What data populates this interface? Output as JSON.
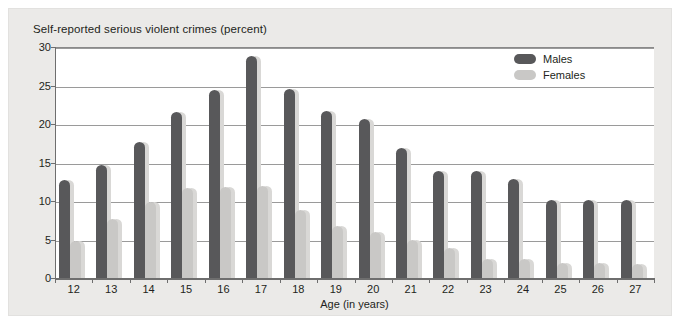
{
  "chart_data": {
    "type": "bar",
    "title": "Self-reported serious violent crimes (percent)",
    "xlabel": "Age (in years)",
    "ylabel": "",
    "ylim": [
      0,
      30
    ],
    "yticks": [
      0,
      5,
      10,
      15,
      20,
      25,
      30
    ],
    "grid": true,
    "legend_position": "top-right",
    "categories": [
      "12",
      "13",
      "14",
      "15",
      "16",
      "17",
      "18",
      "19",
      "20",
      "21",
      "22",
      "23",
      "24",
      "25",
      "26",
      "27"
    ],
    "series": [
      {
        "name": "Males",
        "color": "#58585a",
        "values": [
          12.7,
          14.7,
          17.7,
          21.6,
          24.4,
          28.8,
          24.6,
          21.7,
          20.6,
          16.9,
          13.9,
          13.9,
          12.9,
          10.1,
          10.1,
          10.1
        ]
      },
      {
        "name": "Females",
        "color": "#c9c8c6",
        "values": [
          4.8,
          7.7,
          9.9,
          11.7,
          11.8,
          11.9,
          8.8,
          6.8,
          6.0,
          4.9,
          3.9,
          2.5,
          2.5,
          2.0,
          2.0,
          1.8
        ]
      }
    ]
  },
  "legend": {
    "entries": [
      {
        "label": "Males"
      },
      {
        "label": "Females"
      }
    ]
  },
  "colors": {
    "male": "#58585a",
    "female": "#c9c8c6",
    "panel_background": "#ebeae8",
    "plot_background": "#ffffff",
    "grid": "#9a9a9a",
    "text": "#231f20"
  }
}
